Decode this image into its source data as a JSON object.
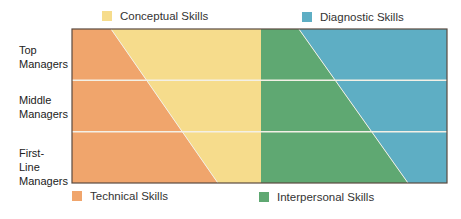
{
  "chart_data": {
    "type": "area",
    "title": "",
    "levels": [
      "Top Managers",
      "Middle Managers",
      "First-Line Managers"
    ],
    "legend": [
      {
        "key": "conceptual",
        "label": "Conceptual Skills",
        "color": "#f6dc8c",
        "placement": "top-left"
      },
      {
        "key": "diagnostic",
        "label": "Diagnostic Skills",
        "color": "#5eaec4",
        "placement": "top-right"
      },
      {
        "key": "technical",
        "label": "Technical Skills",
        "color": "#f0a56c",
        "placement": "bottom-left"
      },
      {
        "key": "interpersonal",
        "label": "Interpersonal Skills",
        "color": "#5fa872",
        "placement": "bottom-right"
      }
    ],
    "series": [
      {
        "name": "Technical Skills",
        "key": "technical",
        "share_top": 0.104,
        "share_bottom": 0.389
      },
      {
        "name": "Conceptual Skills",
        "key": "conceptual",
        "share_top": 0.4,
        "share_bottom": 0.115
      },
      {
        "name": "Interpersonal Skills",
        "key": "interpersonal",
        "share_top": 0.101,
        "share_bottom": 0.392
      },
      {
        "name": "Diagnostic Skills",
        "key": "diagnostic",
        "share_top": 0.395,
        "share_bottom": 0.104
      }
    ],
    "divider_color": "#f3f0e6",
    "frame_color": "#5a4a40"
  }
}
